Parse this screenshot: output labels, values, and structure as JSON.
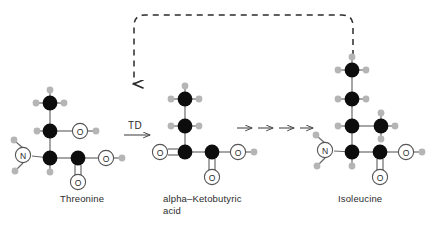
{
  "diagram": {
    "colors": {
      "carbon": "#0d0d0d",
      "hydrogen": "#b3b3b3",
      "heteroatom_outline": "#4d4d4d",
      "bond": "#5a5a5a",
      "arrow": "#4a4a4a",
      "dashed_arrow": "#2b2b2b",
      "text": "#2b2b2b",
      "background": "#ffffff"
    },
    "labels": {
      "threonine": "Threonine",
      "keto_acid": "alpha–Ketobutyric\nacid",
      "isoleucine": "Isoleucine",
      "enzyme": "TD"
    },
    "atom_labels": {
      "nitrogen": "N",
      "oxygen": "O"
    },
    "molecules": [
      {
        "name": "Threonine",
        "label": "Threonine",
        "atoms": [
          {
            "id": "C-methyl",
            "element": "C",
            "x": 50,
            "y": 103
          },
          {
            "id": "C-beta",
            "element": "C",
            "x": 50,
            "y": 131
          },
          {
            "id": "O-hydroxyl",
            "element": "O",
            "x": 80,
            "y": 131
          },
          {
            "id": "C-alpha",
            "element": "C",
            "x": 50,
            "y": 158
          },
          {
            "id": "N-amino",
            "element": "N",
            "x": 23,
            "y": 155
          },
          {
            "id": "C-carboxyl",
            "element": "C",
            "x": 78,
            "y": 158
          },
          {
            "id": "O-carbonyl",
            "element": "O",
            "x": 78,
            "y": 182
          },
          {
            "id": "O-hydroxy-acid",
            "element": "O",
            "x": 106,
            "y": 158
          }
        ]
      },
      {
        "name": "alpha-Ketobutyric acid",
        "label": "alpha–Ketobutyric acid",
        "atoms": [
          {
            "id": "C-methyl",
            "element": "C",
            "x": 185,
            "y": 99
          },
          {
            "id": "C-methylene",
            "element": "C",
            "x": 185,
            "y": 126
          },
          {
            "id": "C-keto",
            "element": "C",
            "x": 185,
            "y": 152
          },
          {
            "id": "O-keto",
            "element": "O",
            "x": 160,
            "y": 152
          },
          {
            "id": "C-carboxyl",
            "element": "C",
            "x": 212,
            "y": 152
          },
          {
            "id": "O-carbonyl",
            "element": "O",
            "x": 212,
            "y": 177
          },
          {
            "id": "O-hydroxy-acid",
            "element": "O",
            "x": 238,
            "y": 152
          }
        ]
      },
      {
        "name": "Isoleucine",
        "label": "Isoleucine",
        "atoms": [
          {
            "id": "C-delta",
            "element": "C",
            "x": 352,
            "y": 70
          },
          {
            "id": "C-gamma",
            "element": "C",
            "x": 352,
            "y": 99
          },
          {
            "id": "C-beta",
            "element": "C",
            "x": 352,
            "y": 126
          },
          {
            "id": "C-methyl-branch",
            "element": "C",
            "x": 381,
            "y": 126
          },
          {
            "id": "C-alpha",
            "element": "C",
            "x": 352,
            "y": 152
          },
          {
            "id": "N-amino",
            "element": "N",
            "x": 325,
            "y": 150
          },
          {
            "id": "C-carboxyl",
            "element": "C",
            "x": 380,
            "y": 152
          },
          {
            "id": "O-carbonyl",
            "element": "O",
            "x": 380,
            "y": 177
          },
          {
            "id": "O-hydroxy-acid",
            "element": "O",
            "x": 406,
            "y": 152
          }
        ]
      }
    ],
    "reaction_arrows": {
      "enzyme_arrow": {
        "label": "TD",
        "from_x": 124,
        "to_x": 152,
        "y": 135
      },
      "multistep_arrows_count": 4,
      "multistep_y": 128
    },
    "feedback_arrow": {
      "description": "dashed feedback inhibition arrow from Isoleucine back to TD step",
      "style": "dashed",
      "direction": "right-to-left-then-down",
      "head": "down"
    }
  }
}
